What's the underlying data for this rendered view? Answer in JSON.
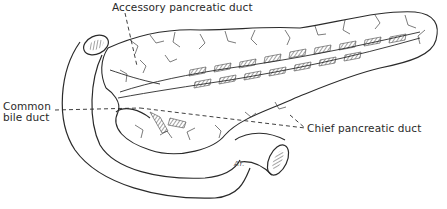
{
  "figure": {
    "line_color": "#2a2a2a",
    "hatch_color": "#555555",
    "background": "#ffffff"
  },
  "labels": {
    "accessory": "Accessory pancreatic duct",
    "common_line1": "Common",
    "common_line2": "bile duct",
    "chief": "Chief pancreatic duct"
  },
  "signature": "AY."
}
